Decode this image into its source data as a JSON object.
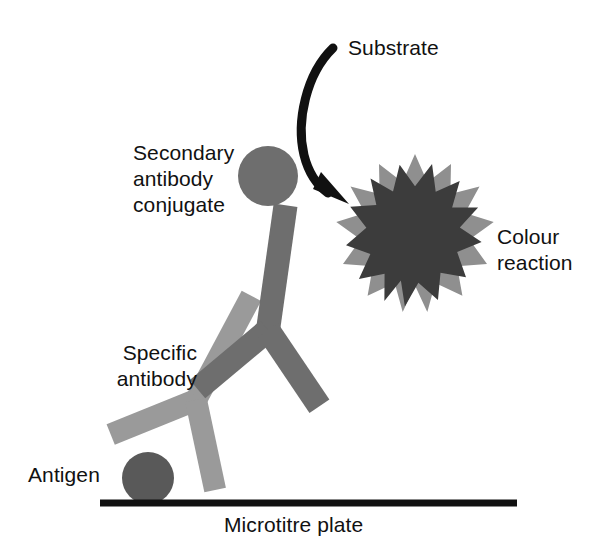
{
  "diagram": {
    "background_color": "#ffffff",
    "labels": {
      "secondary_antibody": "Secondary\nantibody\nconjugate",
      "specific_antibody": "Specific\nantibody",
      "antigen": "Antigen",
      "substrate": "Substrate",
      "colour_reaction": "Colour\nreaction",
      "microtitre_plate": "Microtitre plate"
    },
    "colors": {
      "text": "#111111",
      "plate_line": "#111111",
      "arrow": "#111111",
      "secondary_antibody": "#6e6e6e",
      "specific_antibody": "#9a9a9a",
      "antigen": "#595959",
      "conjugate_circle": "#6e6e6e",
      "star_outer": "#8f8f8f",
      "star_inner": "#3c3c3c"
    },
    "elements": {
      "conjugate_circle": {
        "cx": 268,
        "cy": 176,
        "r": 30
      },
      "antigen_circle": {
        "cx": 148,
        "cy": 478,
        "r": 26
      },
      "plate_line": {
        "x1": 100,
        "y1": 503,
        "x2": 517,
        "y2": 503,
        "thickness": 7
      },
      "star_outer": {
        "cx": 415,
        "cy": 226,
        "points": 12,
        "outer_r": 72,
        "inner_r": 48,
        "rotation": 0
      },
      "star_inner": {
        "cx": 416,
        "cy": 224,
        "points": 12,
        "outer_r": 62,
        "inner_r": 44,
        "rotation": 15
      },
      "substrate_arrow": {
        "start_x": 332,
        "start_y": 46,
        "end_x": 341,
        "end_y": 194
      }
    }
  }
}
